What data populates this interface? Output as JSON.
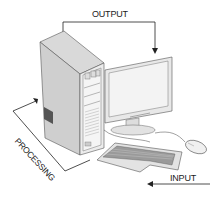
{
  "diagram": {
    "labels": {
      "output": "OUTPUT",
      "processing": "PROCESSING",
      "input": "INPUT"
    },
    "components": [
      "system-unit",
      "monitor",
      "keyboard",
      "mouse"
    ],
    "flows": [
      {
        "from": "system-unit",
        "to": "monitor",
        "label": "OUTPUT"
      },
      {
        "from": "keyboard",
        "to": "system-unit",
        "label": "PROCESSING"
      },
      {
        "from": "external",
        "to": "keyboard",
        "label": "INPUT"
      }
    ],
    "colors": {
      "line": "#222222",
      "case_light": "#e6e6e6",
      "case_dark": "#bdbdbd",
      "screen": "#f2f2f2",
      "background": "#ffffff"
    }
  }
}
